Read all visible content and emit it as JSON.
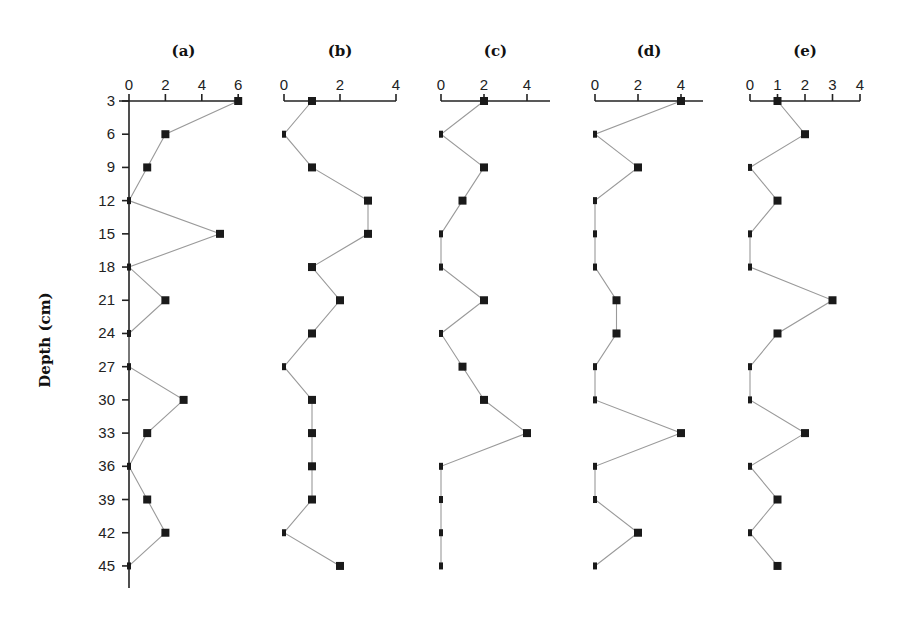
{
  "chart_data": [
    {
      "type": "line",
      "panel": "(a)",
      "title": "(a)",
      "xlabel": "",
      "ylabel": "Depth (cm)",
      "x_ticks": [
        0,
        2,
        4,
        6
      ],
      "xlim": [
        0,
        6
      ],
      "depth": [
        3,
        6,
        9,
        12,
        15,
        18,
        21,
        24,
        27,
        30,
        33,
        36,
        39,
        42,
        45
      ],
      "values": [
        6,
        2,
        1,
        0,
        5,
        0,
        2,
        0,
        0,
        3,
        1,
        0,
        1,
        2,
        0
      ]
    },
    {
      "type": "line",
      "panel": "(b)",
      "title": "(b)",
      "xlabel": "",
      "x_ticks": [
        0,
        2,
        4
      ],
      "xlim": [
        0,
        4
      ],
      "depth": [
        3,
        6,
        9,
        12,
        15,
        18,
        21,
        24,
        27,
        30,
        33,
        36,
        39,
        42,
        45
      ],
      "values": [
        1,
        0,
        1,
        3,
        3,
        1,
        2,
        1,
        0,
        1,
        1,
        1,
        1,
        0,
        2
      ]
    },
    {
      "type": "line",
      "panel": "(c)",
      "title": "(c)",
      "xlabel": "",
      "x_ticks": [
        0,
        2,
        4
      ],
      "xlim": [
        0,
        5
      ],
      "depth": [
        3,
        6,
        9,
        12,
        15,
        18,
        21,
        24,
        27,
        30,
        33,
        36,
        39,
        42,
        45
      ],
      "values": [
        2,
        0,
        2,
        1,
        0,
        0,
        2,
        0,
        1,
        2,
        4,
        0,
        0,
        0,
        0
      ]
    },
    {
      "type": "line",
      "panel": "(d)",
      "title": "(d)",
      "xlabel": "",
      "x_ticks": [
        0,
        2,
        4
      ],
      "xlim": [
        0,
        5
      ],
      "depth": [
        3,
        6,
        9,
        12,
        15,
        18,
        21,
        24,
        27,
        30,
        33,
        36,
        39,
        42,
        45
      ],
      "values": [
        4,
        0,
        2,
        0,
        0,
        0,
        1,
        1,
        0,
        0,
        4,
        0,
        0,
        2,
        0
      ]
    },
    {
      "type": "line",
      "panel": "(e)",
      "title": "(e)",
      "xlabel": "",
      "x_ticks": [
        0,
        1,
        2,
        3,
        4
      ],
      "xlim": [
        0,
        4
      ],
      "depth": [
        3,
        6,
        9,
        12,
        15,
        18,
        21,
        24,
        27,
        30,
        33,
        36,
        39,
        42,
        45
      ],
      "values": [
        1,
        2,
        0,
        1,
        0,
        0,
        3,
        1,
        0,
        0,
        2,
        0,
        1,
        0,
        1
      ]
    }
  ],
  "shared_y_axis": {
    "label": "Depth (cm)",
    "ticks": [
      3,
      6,
      9,
      12,
      15,
      18,
      21,
      24,
      27,
      30,
      33,
      36,
      39,
      42,
      45
    ],
    "inverted": true,
    "grid": false
  },
  "layout": {
    "panels": [
      {
        "x0": 129,
        "px_per_unit": 18.2,
        "axis_end": 238
      },
      {
        "x0": 284,
        "px_per_unit": 28.0,
        "axis_end": 396
      },
      {
        "x0": 441,
        "px_per_unit": 21.5,
        "axis_end": 550
      },
      {
        "x0": 595,
        "px_per_unit": 21.5,
        "axis_end": 703
      },
      {
        "x0": 750,
        "px_per_unit": 27.5,
        "axis_end": 860
      }
    ],
    "axis_y": 101,
    "depth_y0": 101,
    "depth_px_per_cm": 11.07,
    "y_axis_bottom": 588,
    "title_y": 56,
    "tick_label_y": 90
  }
}
